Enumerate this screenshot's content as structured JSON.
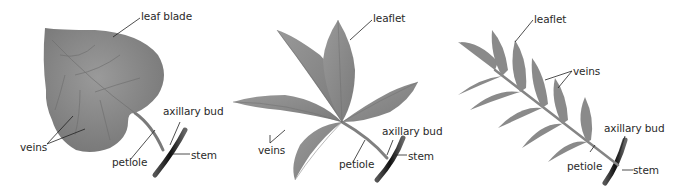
{
  "diagrams": [
    {
      "id": "simple-leaf",
      "labels": {
        "leaf_blade": "leaf blade",
        "veins": "veins",
        "petiole": "petiole",
        "axillary_bud": "axillary bud",
        "stem": "stem"
      }
    },
    {
      "id": "palmately-compound-leaf",
      "labels": {
        "leaflet": "leaflet",
        "veins": "veins",
        "petiole": "petiole",
        "axillary_bud": "axillary bud",
        "stem": "stem"
      }
    },
    {
      "id": "pinnately-compound-leaf",
      "labels": {
        "leaflet": "leaflet",
        "veins": "veins",
        "petiole": "petiole",
        "axillary_bud": "axillary bud",
        "stem": "stem"
      }
    }
  ],
  "colors": {
    "leaf_fill": "#8c8c8c",
    "leaf_dark": "#6e6e6e",
    "stem": "#1e1e1e",
    "leader_line": "#222222",
    "label_text": "#2a2a2a"
  }
}
